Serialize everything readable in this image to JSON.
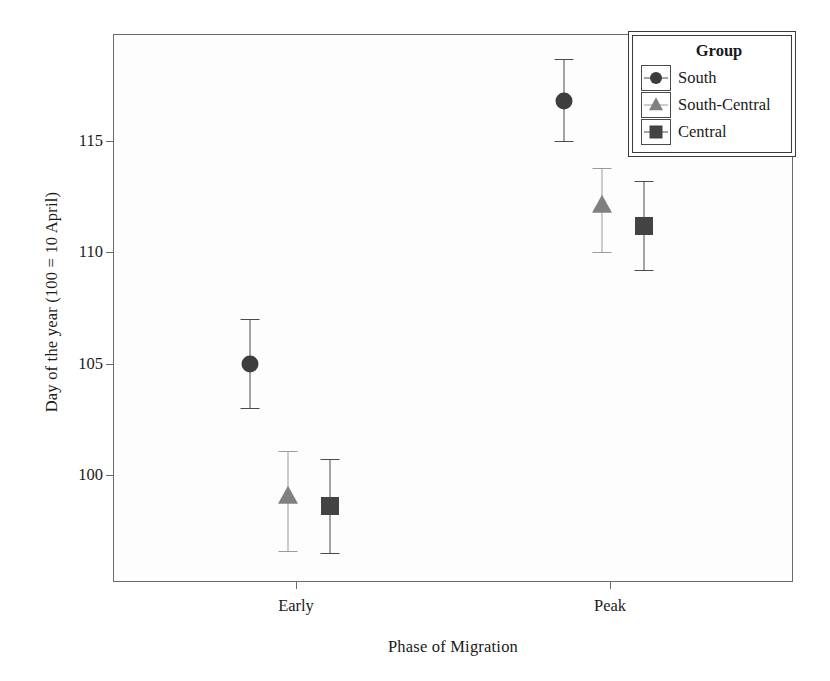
{
  "chart_data": {
    "type": "scatter",
    "title": "",
    "xlabel": "Phase of Migration",
    "ylabel": "Day of the year (100 = 10 April)",
    "categories": [
      "Early",
      "Peak"
    ],
    "ytick_labels": [
      "100",
      "105",
      "110",
      "115"
    ],
    "ytick_values": [
      100,
      105,
      110,
      115
    ],
    "ylim": [
      95.2,
      119.8
    ],
    "grid": false,
    "legend_position": "top-right",
    "legend_title": "Group",
    "series": [
      {
        "name": "South",
        "marker": "circle",
        "color": "#3d3d3d",
        "errorbar_color": "#4a4a4a",
        "points": [
          {
            "category": "Early",
            "value": 105.0,
            "low": 103.0,
            "high": 107.0
          },
          {
            "category": "Peak",
            "value": 116.8,
            "low": 115.0,
            "high": 118.7
          }
        ]
      },
      {
        "name": "South-Central",
        "marker": "triangle",
        "color": "#808080",
        "errorbar_color": "#9a9a9a",
        "points": [
          {
            "category": "Early",
            "value": 99.0,
            "low": 96.6,
            "high": 101.1
          },
          {
            "category": "Peak",
            "value": 112.1,
            "low": 110.0,
            "high": 113.8
          }
        ]
      },
      {
        "name": "Central",
        "marker": "square",
        "color": "#434343",
        "errorbar_color": "#4a4a4a",
        "points": [
          {
            "category": "Early",
            "value": 98.6,
            "low": 96.5,
            "high": 100.7
          },
          {
            "category": "Peak",
            "value": 111.2,
            "low": 109.2,
            "high": 113.2
          }
        ]
      }
    ]
  },
  "axes": {
    "y_title": "Day of the year (100 = 10 April)",
    "x_title": "Phase of Migration",
    "y_ticks": [
      {
        "label": "115",
        "value": 115
      },
      {
        "label": "110",
        "value": 110
      },
      {
        "label": "105",
        "value": 105
      },
      {
        "label": "100",
        "value": 100
      }
    ],
    "x_ticks": [
      {
        "label": "Early"
      },
      {
        "label": "Peak"
      }
    ]
  },
  "legend": {
    "title": "Group",
    "entries": [
      {
        "label": "South"
      },
      {
        "label": "South-Central"
      },
      {
        "label": "Central"
      }
    ]
  }
}
